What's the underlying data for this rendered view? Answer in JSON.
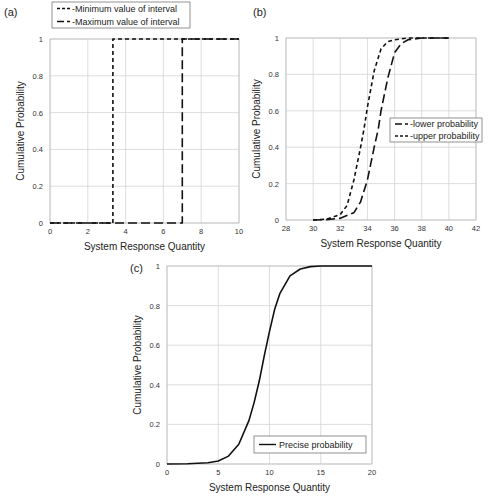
{
  "chart_data": [
    {
      "id": "a",
      "panel_label": "(a)",
      "type": "line",
      "xlabel": "System Response Quantity",
      "ylabel": "Cumulative Probability",
      "xlim": [
        0,
        10
      ],
      "ylim": [
        0,
        1
      ],
      "xticks": [
        0,
        2,
        4,
        6,
        8,
        10
      ],
      "yticks": [
        0,
        0.2,
        0.4,
        0.6,
        0.8,
        1
      ],
      "grid": true,
      "legend_position": "top-left, above plot",
      "series": [
        {
          "name": "Minimum value of interval",
          "style": "short-dash",
          "x": [
            0,
            3.33,
            3.33,
            10
          ],
          "y": [
            0,
            0,
            1,
            1
          ]
        },
        {
          "name": "Maximum value of interval",
          "style": "long-dash",
          "x": [
            0,
            7.0,
            7.0,
            10
          ],
          "y": [
            0,
            0,
            1,
            1
          ]
        }
      ]
    },
    {
      "id": "b",
      "panel_label": "(b)",
      "type": "line",
      "xlabel": "System Response Quantity",
      "ylabel": "Cumulative Probability",
      "xlim": [
        28,
        42
      ],
      "ylim": [
        0,
        1
      ],
      "xticks": [
        28,
        30,
        32,
        34,
        36,
        38,
        40,
        42
      ],
      "yticks": [
        0,
        0.2,
        0.4,
        0.6,
        0.8,
        1
      ],
      "grid": true,
      "legend_position": "right-middle",
      "series": [
        {
          "name": "lower probability",
          "style": "long-dash",
          "x": [
            30,
            31,
            32,
            33,
            33.5,
            34,
            34.5,
            34.8,
            35,
            35.5,
            36,
            36.5,
            37,
            38,
            40
          ],
          "y": [
            0,
            0.002,
            0.01,
            0.04,
            0.1,
            0.22,
            0.4,
            0.5,
            0.6,
            0.78,
            0.92,
            0.97,
            0.99,
            1,
            1
          ]
        },
        {
          "name": "upper probability",
          "style": "short-dash",
          "x": [
            30,
            31,
            32,
            32.5,
            33,
            33.5,
            33.75,
            34,
            34.5,
            35,
            35.5,
            36,
            37,
            38,
            40
          ],
          "y": [
            0,
            0.005,
            0.03,
            0.08,
            0.22,
            0.4,
            0.5,
            0.62,
            0.82,
            0.94,
            0.98,
            0.99,
            1,
            1,
            1
          ]
        }
      ]
    },
    {
      "id": "c",
      "panel_label": "(c)",
      "type": "line",
      "xlabel": "System Response Quantity",
      "ylabel": "Cumulative Probability",
      "xlim": [
        0,
        20
      ],
      "ylim": [
        0,
        1
      ],
      "xticks": [
        0,
        5,
        10,
        15,
        20
      ],
      "yticks": [
        0,
        0.2,
        0.4,
        0.6,
        0.8,
        1
      ],
      "grid": true,
      "legend_position": "bottom-right",
      "series": [
        {
          "name": "Precise probability",
          "style": "solid",
          "x": [
            0,
            2,
            4,
            5,
            6,
            7,
            8,
            8.5,
            9,
            9.5,
            10,
            10.5,
            11,
            12,
            13,
            14,
            15,
            17,
            20
          ],
          "y": [
            0,
            0.001,
            0.006,
            0.015,
            0.04,
            0.1,
            0.22,
            0.31,
            0.42,
            0.55,
            0.67,
            0.78,
            0.86,
            0.95,
            0.985,
            0.997,
            1,
            1,
            1
          ]
        }
      ]
    }
  ]
}
